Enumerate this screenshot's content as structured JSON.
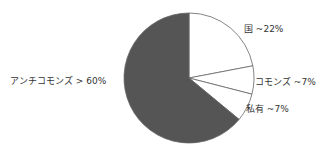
{
  "chart_data": {
    "type": "pie",
    "title": "",
    "slices": [
      {
        "label": "国",
        "value_text": "~22%",
        "value": 22,
        "color": "#ffffff"
      },
      {
        "label": "コモンズ",
        "value_text": "~7%",
        "value": 7,
        "color": "#ffffff"
      },
      {
        "label": "私有",
        "value_text": "~7%",
        "value": 7,
        "color": "#ffffff"
      },
      {
        "label": "アンチコモンズ",
        "value_text": "> 60%",
        "value": 64,
        "color": "#555555"
      }
    ]
  },
  "labels": {
    "state": "国 ~22%",
    "commons": "コモンズ ~7%",
    "private": "私有 ~7%",
    "anticommons": "アンチコモンズ > 60%"
  }
}
